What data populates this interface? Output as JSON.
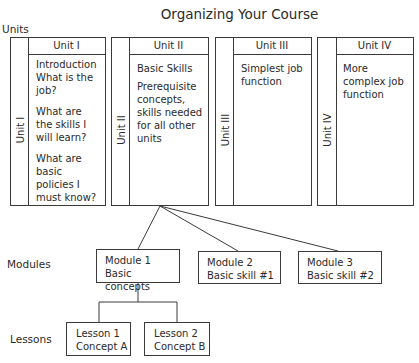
{
  "title": "Organizing Your Course",
  "row_labels": {
    "units": "Units",
    "modules": "Modules",
    "lessons": "Lessons"
  },
  "units": [
    {
      "header": "Unit I",
      "side_label": "Unit I",
      "paragraphs": [
        "Introduction What is the job?",
        "What are the skills I will learn?",
        "What are basic policies I must know?"
      ]
    },
    {
      "header": "Unit II",
      "side_label": "Unit II",
      "paragraphs": [
        "Basic Skills",
        "Prerequisite concepts, skills needed for all other units"
      ]
    },
    {
      "header": "Unit III",
      "side_label": "Unit III",
      "paragraphs": [
        "Simplest job function"
      ]
    },
    {
      "header": "Unit IV",
      "side_label": "Unit IV",
      "paragraphs": [
        "More complex job function"
      ]
    }
  ],
  "modules": [
    {
      "name": "Module 1",
      "desc": "Basic concepts"
    },
    {
      "name": "Module 2",
      "desc": "Basic skill #1"
    },
    {
      "name": "Module 3",
      "desc": "Basic skill #2"
    }
  ],
  "lessons": [
    {
      "name": "Lesson 1",
      "desc": "Concept A"
    },
    {
      "name": "Lesson 2",
      "desc": "Concept B"
    }
  ],
  "colors": {
    "line": "#3a3a3a",
    "text": "#2a2a2a",
    "background": "#ffffff"
  }
}
